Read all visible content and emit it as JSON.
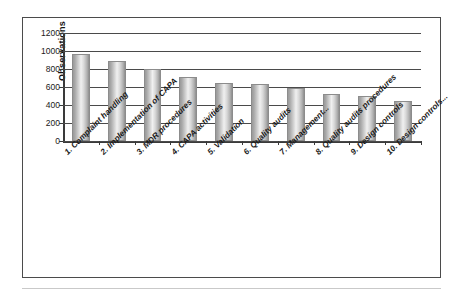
{
  "chart_data": {
    "type": "bar",
    "title": "",
    "xlabel": "",
    "ylabel": "Observations",
    "ylim": [
      0,
      1200
    ],
    "ytick_step": 200,
    "yticks": [
      "1200",
      "1000",
      "800",
      "600",
      "400",
      "200",
      "0"
    ],
    "grid": true,
    "legend": "none",
    "orientation": "vertical",
    "bar_color": "#c9c9c9",
    "categories": [
      "1. Complaint handling",
      "2. Implementation of CAPA",
      "3. MDR procedures",
      "4. CAPA activities",
      "5. Validation",
      "6. Quality audits",
      "7. Management...",
      "8. Quality audits procedures",
      "9. Design controls",
      "10. Design controls..."
    ],
    "values": [
      970,
      890,
      800,
      710,
      650,
      630,
      590,
      520,
      505,
      445
    ]
  },
  "figure": {
    "border_color": "#4b4b4b",
    "background": "#ffffff"
  }
}
